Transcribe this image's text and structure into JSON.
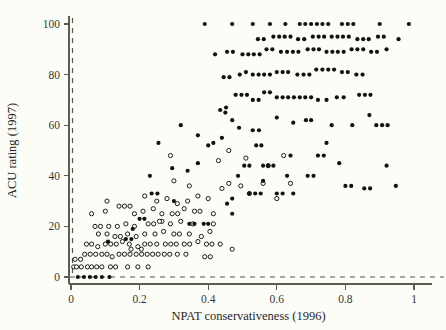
{
  "figure": {
    "background_color": "#fdfdf8",
    "width": 446,
    "height": 330
  },
  "chart_data": {
    "type": "scatter",
    "title": "",
    "xlabel": "NPAT conservativeness (1996)",
    "ylabel": "ACU rating (1997)",
    "xlim": [
      -0.035,
      1.06
    ],
    "ylim": [
      -6,
      105
    ],
    "xticks": [
      0,
      0.2,
      0.4,
      0.6,
      0.8,
      1
    ],
    "xticklabels": [
      "0",
      "0.2",
      "0.4",
      "0.6",
      "0.8",
      "1"
    ],
    "yticks": [
      0,
      20,
      40,
      60,
      80,
      100
    ],
    "yticklabels": [
      "0",
      "20",
      "40",
      "60",
      "80",
      "100"
    ],
    "grid": false,
    "legend": null,
    "annotations": [
      {
        "type": "vline",
        "value": 0,
        "style": "dashed",
        "color": "#55554d"
      },
      {
        "type": "hline",
        "value": 0,
        "style": "dashed",
        "color": "#55554d"
      }
    ],
    "marker_size_px": 4.2,
    "series": [
      {
        "name": "filled",
        "marker": "filled-circle",
        "color": "#111111",
        "points": [
          [
            0.02,
            0.0
          ],
          [
            0.038,
            0.0
          ],
          [
            0.055,
            0.0
          ],
          [
            0.072,
            0.0
          ],
          [
            0.09,
            0.0
          ],
          [
            0.112,
            0.0
          ],
          [
            0.455,
            29.0
          ],
          [
            0.47,
            31.0
          ],
          [
            0.487,
            40.0
          ],
          [
            0.52,
            33.0
          ],
          [
            0.537,
            33.0
          ],
          [
            0.553,
            33.0
          ],
          [
            0.6,
            33.0
          ],
          [
            0.617,
            33.0
          ],
          [
            0.648,
            33.0
          ],
          [
            0.387,
            21.0
          ],
          [
            0.4,
            21.0
          ],
          [
            0.505,
            44.0
          ],
          [
            0.52,
            44.0
          ],
          [
            0.56,
            44.0
          ],
          [
            0.575,
            44.0
          ],
          [
            0.59,
            44.0
          ],
          [
            0.54,
            52.0
          ],
          [
            0.555,
            52.0
          ],
          [
            0.64,
            48.0
          ],
          [
            0.72,
            48.0
          ],
          [
            0.737,
            48.0
          ],
          [
            0.32,
            60.0
          ],
          [
            0.37,
            56.0
          ],
          [
            0.435,
            66.0
          ],
          [
            0.45,
            65.0
          ],
          [
            0.452,
            67.0
          ],
          [
            0.47,
            62.0
          ],
          [
            0.49,
            59.0
          ],
          [
            0.53,
            58.0
          ],
          [
            0.548,
            58.0
          ],
          [
            0.4,
            52.0
          ],
          [
            0.415,
            53.0
          ],
          [
            0.37,
            45.0
          ],
          [
            0.34,
            42.0
          ],
          [
            0.295,
            43.0
          ],
          [
            0.255,
            53.0
          ],
          [
            0.23,
            40.0
          ],
          [
            0.235,
            33.0
          ],
          [
            0.252,
            33.0
          ],
          [
            0.2,
            23.0
          ],
          [
            0.214,
            23.0
          ],
          [
            0.48,
            72.0
          ],
          [
            0.497,
            72.0
          ],
          [
            0.513,
            72.0
          ],
          [
            0.53,
            70.0
          ],
          [
            0.547,
            70.0
          ],
          [
            0.563,
            73.0
          ],
          [
            0.58,
            73.0
          ],
          [
            0.6,
            71.0
          ],
          [
            0.617,
            71.0
          ],
          [
            0.633,
            71.0
          ],
          [
            0.65,
            71.0
          ],
          [
            0.667,
            71.0
          ],
          [
            0.683,
            71.0
          ],
          [
            0.7,
            71.0
          ],
          [
            0.72,
            70.0
          ],
          [
            0.745,
            70.0
          ],
          [
            0.775,
            71.0
          ],
          [
            0.795,
            71.0
          ],
          [
            0.84,
            72.0
          ],
          [
            0.857,
            72.0
          ],
          [
            0.873,
            72.0
          ],
          [
            0.445,
            79.0
          ],
          [
            0.462,
            79.0
          ],
          [
            0.492,
            80.0
          ],
          [
            0.51,
            81.0
          ],
          [
            0.53,
            80.0
          ],
          [
            0.547,
            80.0
          ],
          [
            0.563,
            80.0
          ],
          [
            0.58,
            80.0
          ],
          [
            0.6,
            81.0
          ],
          [
            0.617,
            81.0
          ],
          [
            0.633,
            81.0
          ],
          [
            0.66,
            80.0
          ],
          [
            0.678,
            80.0
          ],
          [
            0.695,
            80.0
          ],
          [
            0.715,
            82.0
          ],
          [
            0.733,
            82.0
          ],
          [
            0.75,
            82.0
          ],
          [
            0.767,
            82.0
          ],
          [
            0.79,
            81.0
          ],
          [
            0.807,
            81.0
          ],
          [
            0.832,
            80.0
          ],
          [
            0.85,
            80.0
          ],
          [
            0.42,
            88.0
          ],
          [
            0.455,
            89.0
          ],
          [
            0.472,
            89.0
          ],
          [
            0.5,
            88.0
          ],
          [
            0.517,
            88.0
          ],
          [
            0.533,
            88.0
          ],
          [
            0.55,
            88.0
          ],
          [
            0.57,
            90.0
          ],
          [
            0.587,
            90.0
          ],
          [
            0.612,
            89.0
          ],
          [
            0.63,
            89.0
          ],
          [
            0.647,
            89.0
          ],
          [
            0.663,
            89.0
          ],
          [
            0.69,
            90.0
          ],
          [
            0.707,
            90.0
          ],
          [
            0.723,
            90.0
          ],
          [
            0.745,
            89.0
          ],
          [
            0.762,
            89.0
          ],
          [
            0.778,
            89.0
          ],
          [
            0.795,
            89.0
          ],
          [
            0.818,
            90.0
          ],
          [
            0.835,
            90.0
          ],
          [
            0.852,
            90.0
          ],
          [
            0.875,
            89.0
          ],
          [
            0.892,
            89.0
          ],
          [
            0.92,
            90.0
          ],
          [
            0.545,
            94.0
          ],
          [
            0.562,
            94.0
          ],
          [
            0.59,
            95.0
          ],
          [
            0.607,
            95.0
          ],
          [
            0.623,
            95.0
          ],
          [
            0.64,
            95.0
          ],
          [
            0.662,
            94.0
          ],
          [
            0.68,
            94.0
          ],
          [
            0.705,
            95.0
          ],
          [
            0.722,
            95.0
          ],
          [
            0.738,
            95.0
          ],
          [
            0.76,
            95.0
          ],
          [
            0.777,
            95.0
          ],
          [
            0.793,
            95.0
          ],
          [
            0.81,
            95.0
          ],
          [
            0.835,
            94.0
          ],
          [
            0.852,
            94.0
          ],
          [
            0.868,
            94.0
          ],
          [
            0.895,
            95.0
          ],
          [
            0.912,
            95.0
          ],
          [
            0.955,
            94.0
          ],
          [
            0.39,
            100.0
          ],
          [
            0.47,
            100.0
          ],
          [
            0.53,
            100.0
          ],
          [
            0.58,
            100.0
          ],
          [
            0.625,
            100.0
          ],
          [
            0.667,
            100.0
          ],
          [
            0.683,
            100.0
          ],
          [
            0.7,
            100.0
          ],
          [
            0.717,
            100.0
          ],
          [
            0.733,
            100.0
          ],
          [
            0.75,
            100.0
          ],
          [
            0.79,
            100.0
          ],
          [
            0.807,
            100.0
          ],
          [
            0.823,
            100.0
          ],
          [
            0.9,
            100.0
          ],
          [
            0.985,
            100.0
          ],
          [
            0.87,
            64.0
          ],
          [
            0.82,
            60.0
          ],
          [
            0.89,
            60.0
          ],
          [
            0.907,
            60.0
          ],
          [
            0.923,
            60.0
          ],
          [
            0.76,
            60.0
          ],
          [
            0.685,
            62.0
          ],
          [
            0.7,
            62.0
          ],
          [
            0.648,
            61.0
          ],
          [
            0.6,
            63.0
          ],
          [
            0.44,
            55.0
          ],
          [
            0.3,
            30.0
          ],
          [
            0.745,
            53.0
          ],
          [
            0.782,
            45.0
          ],
          [
            0.8,
            36.0
          ],
          [
            0.817,
            36.0
          ],
          [
            0.855,
            35.0
          ],
          [
            0.872,
            35.0
          ],
          [
            0.69,
            40.0
          ],
          [
            0.707,
            40.0
          ],
          [
            0.63,
            40.0
          ],
          [
            0.56,
            38.0
          ],
          [
            0.92,
            44.0
          ],
          [
            0.947,
            36.0
          ],
          [
            0.47,
            25.0
          ],
          [
            0.345,
            21.0
          ],
          [
            0.36,
            21.0
          ],
          [
            0.16,
            15.0
          ],
          [
            0.176,
            15.0
          ],
          [
            0.108,
            14.0
          ],
          [
            0.18,
            19.0
          ]
        ]
      },
      {
        "name": "open",
        "marker": "open-circle",
        "color": "#1a1a1a",
        "points": [
          [
            0.008,
            4.0
          ],
          [
            0.016,
            4.0
          ],
          [
            0.012,
            7.0
          ],
          [
            0.028,
            7.0
          ],
          [
            0.03,
            4.0
          ],
          [
            0.048,
            4.0
          ],
          [
            0.06,
            4.0
          ],
          [
            0.075,
            4.0
          ],
          [
            0.09,
            4.0
          ],
          [
            0.115,
            4.0
          ],
          [
            0.13,
            4.0
          ],
          [
            0.165,
            4.0
          ],
          [
            0.195,
            4.0
          ],
          [
            0.225,
            4.0
          ],
          [
            0.04,
            9.0
          ],
          [
            0.056,
            9.0
          ],
          [
            0.072,
            9.0
          ],
          [
            0.09,
            9.0
          ],
          [
            0.105,
            9.0
          ],
          [
            0.12,
            8.0
          ],
          [
            0.14,
            9.0
          ],
          [
            0.156,
            9.0
          ],
          [
            0.172,
            9.0
          ],
          [
            0.19,
            9.0
          ],
          [
            0.206,
            9.0
          ],
          [
            0.222,
            9.0
          ],
          [
            0.238,
            9.0
          ],
          [
            0.254,
            9.0
          ],
          [
            0.272,
            9.0
          ],
          [
            0.288,
            9.0
          ],
          [
            0.31,
            9.0
          ],
          [
            0.335,
            9.0
          ],
          [
            0.39,
            8.0
          ],
          [
            0.406,
            8.0
          ],
          [
            0.045,
            13.0
          ],
          [
            0.06,
            13.0
          ],
          [
            0.078,
            12.0
          ],
          [
            0.1,
            13.0
          ],
          [
            0.116,
            13.0
          ],
          [
            0.132,
            13.0
          ],
          [
            0.15,
            14.0
          ],
          [
            0.17,
            13.0
          ],
          [
            0.195,
            12.0
          ],
          [
            0.215,
            13.0
          ],
          [
            0.231,
            13.0
          ],
          [
            0.25,
            13.0
          ],
          [
            0.275,
            13.0
          ],
          [
            0.291,
            13.0
          ],
          [
            0.307,
            13.0
          ],
          [
            0.33,
            13.0
          ],
          [
            0.346,
            13.0
          ],
          [
            0.37,
            14.0
          ],
          [
            0.395,
            13.0
          ],
          [
            0.411,
            13.0
          ],
          [
            0.435,
            13.0
          ],
          [
            0.08,
            17.0
          ],
          [
            0.105,
            17.0
          ],
          [
            0.128,
            16.0
          ],
          [
            0.144,
            16.0
          ],
          [
            0.165,
            17.0
          ],
          [
            0.19,
            16.0
          ],
          [
            0.215,
            17.0
          ],
          [
            0.245,
            17.0
          ],
          [
            0.27,
            18.0
          ],
          [
            0.3,
            17.0
          ],
          [
            0.316,
            17.0
          ],
          [
            0.345,
            17.0
          ],
          [
            0.38,
            16.0
          ],
          [
            0.405,
            18.0
          ],
          [
            0.07,
            20.0
          ],
          [
            0.086,
            20.0
          ],
          [
            0.11,
            20.0
          ],
          [
            0.135,
            20.0
          ],
          [
            0.16,
            21.0
          ],
          [
            0.185,
            20.0
          ],
          [
            0.225,
            21.0
          ],
          [
            0.241,
            21.0
          ],
          [
            0.265,
            22.0
          ],
          [
            0.29,
            21.0
          ],
          [
            0.32,
            22.0
          ],
          [
            0.355,
            21.0
          ],
          [
            0.415,
            21.0
          ],
          [
            0.06,
            25.0
          ],
          [
            0.1,
            26.0
          ],
          [
            0.14,
            28.0
          ],
          [
            0.156,
            28.0
          ],
          [
            0.172,
            28.0
          ],
          [
            0.185,
            25.0
          ],
          [
            0.21,
            26.0
          ],
          [
            0.24,
            27.0
          ],
          [
            0.265,
            25.0
          ],
          [
            0.295,
            25.0
          ],
          [
            0.311,
            25.0
          ],
          [
            0.33,
            27.0
          ],
          [
            0.36,
            26.0
          ],
          [
            0.376,
            26.0
          ],
          [
            0.415,
            25.0
          ],
          [
            0.105,
            30.0
          ],
          [
            0.215,
            32.0
          ],
          [
            0.25,
            30.0
          ],
          [
            0.28,
            31.0
          ],
          [
            0.31,
            29.0
          ],
          [
            0.34,
            30.0
          ],
          [
            0.37,
            32.0
          ],
          [
            0.4,
            31.0
          ],
          [
            0.44,
            35.0
          ],
          [
            0.46,
            37.0
          ],
          [
            0.495,
            36.0
          ],
          [
            0.52,
            33.0
          ],
          [
            0.56,
            37.0
          ],
          [
            0.6,
            31.0
          ],
          [
            0.64,
            37.0
          ],
          [
            0.3,
            38.0
          ],
          [
            0.43,
            46.0
          ],
          [
            0.46,
            50.0
          ],
          [
            0.51,
            47.0
          ],
          [
            0.575,
            44.0
          ],
          [
            0.62,
            48.0
          ],
          [
            0.29,
            48.0
          ],
          [
            0.345,
            36.0
          ],
          [
            0.258,
            22.0
          ],
          [
            0.175,
            11.0
          ],
          [
            0.205,
            11.0
          ],
          [
            0.47,
            11.0
          ]
        ]
      }
    ]
  }
}
